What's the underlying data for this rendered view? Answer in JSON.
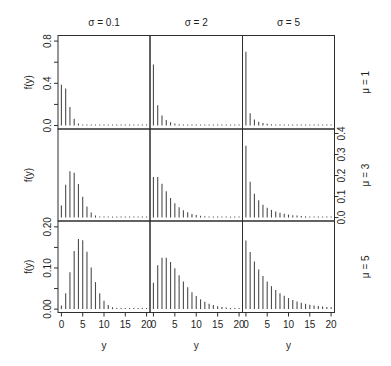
{
  "chart_data": {
    "type": "bar",
    "plot_style": "needle",
    "title": "",
    "xlabel": "y",
    "ylabel": "f(y)",
    "grid": false,
    "legend": null,
    "x": [
      0,
      1,
      2,
      3,
      4,
      5,
      6,
      7,
      8,
      9,
      10,
      11,
      12,
      13,
      14,
      15,
      16,
      17,
      18,
      19,
      20
    ],
    "xlim": [
      0,
      20
    ],
    "x_ticks": [
      0,
      5,
      10,
      15,
      20
    ],
    "x_tick_labels": [
      "0",
      "5",
      "10",
      "15",
      "20"
    ],
    "columns": [
      {
        "label": "σ = 0.1",
        "sigma": 0.1
      },
      {
        "label": "σ = 2",
        "sigma": 2
      },
      {
        "label": "σ = 5",
        "sigma": 5
      }
    ],
    "rows": [
      {
        "label": "μ = 1",
        "mu": 1,
        "ylim": [
          0,
          0.82
        ],
        "axis_side": "left",
        "y_ticks": [
          0,
          0.2,
          0.4,
          0.6,
          0.8
        ],
        "y_tick_labels": [
          "0.0",
          "",
          "0.4",
          "",
          "0.8"
        ]
      },
      {
        "label": "μ = 3",
        "mu": 3,
        "ylim": [
          0,
          0.405
        ],
        "axis_side": "right",
        "y_ticks": [
          0,
          0.1,
          0.2,
          0.3,
          0.4
        ],
        "y_tick_labels": [
          "0.0",
          "0.1",
          "0.2",
          "0.3",
          "0.4"
        ]
      },
      {
        "label": "μ = 5",
        "mu": 5,
        "ylim": [
          0,
          0.206
        ],
        "axis_side": "left",
        "y_ticks": [
          0,
          0.05,
          0.1,
          0.15,
          0.2
        ],
        "y_tick_labels": [
          "0.00",
          "",
          "0.10",
          "",
          "0.20"
        ]
      }
    ],
    "panels": [
      {
        "row": 0,
        "col": 0,
        "mu": 1,
        "sigma": 0.1,
        "values": [
          0.3855,
          0.3505,
          0.1752,
          0.0637,
          0.0188,
          0.0048,
          0.0011,
          0.0002,
          0,
          0,
          0,
          0,
          0,
          0,
          0,
          0,
          0,
          0,
          0,
          0,
          0
        ]
      },
      {
        "row": 0,
        "col": 1,
        "mu": 1,
        "sigma": 2,
        "values": [
          0.5774,
          0.1925,
          0.0962,
          0.0535,
          0.0312,
          0.0187,
          0.0114,
          0.0071,
          0.0044,
          0.0028,
          0.0018,
          0.0011,
          0.0007,
          0.0005,
          0.0003,
          0.0002,
          0.0001,
          0.0001,
          0.0001,
          0,
          0
        ]
      },
      {
        "row": 0,
        "col": 2,
        "mu": 1,
        "sigma": 5,
        "values": [
          0.6988,
          0.1165,
          0.0582,
          0.0356,
          0.0237,
          0.0166,
          0.012,
          0.0089,
          0.0066,
          0.005,
          0.0039,
          0.003,
          0.0023,
          0.0018,
          0.0014,
          0.0011,
          0.0009,
          0.0007,
          0.0006,
          0.0005,
          0.0004
        ]
      },
      {
        "row": 1,
        "col": 0,
        "mu": 3,
        "sigma": 0.1,
        "values": [
          0.0573,
          0.1563,
          0.2203,
          0.2136,
          0.1602,
          0.0991,
          0.0525,
          0.0246,
          0.0103,
          0.004,
          0.0014,
          0.0005,
          0.0001,
          0,
          0,
          0,
          0,
          0,
          0,
          0,
          0
        ]
      },
      {
        "row": 1,
        "col": 1,
        "mu": 3,
        "sigma": 2,
        "values": [
          0.1925,
          0.1925,
          0.1604,
          0.1247,
          0.0936,
          0.0686,
          0.0496,
          0.0354,
          0.0251,
          0.0176,
          0.0124,
          0.0086,
          0.006,
          0.0041,
          0.0029,
          0.002,
          0.0014,
          0.0009,
          0.0006,
          0.0004,
          0.0003
        ]
      },
      {
        "row": 1,
        "col": 2,
        "mu": 3,
        "sigma": 5,
        "values": [
          0.3413,
          0.1706,
          0.1138,
          0.0822,
          0.0616,
          0.0472,
          0.0367,
          0.0289,
          0.0229,
          0.0182,
          0.0146,
          0.0117,
          0.0094,
          0.0076,
          0.0062,
          0.005,
          0.0041,
          0.0033,
          0.0027,
          0.0022,
          0.0018
        ]
      },
      {
        "row": 2,
        "col": 0,
        "mu": 5,
        "sigma": 0.1,
        "values": [
          0.0085,
          0.0387,
          0.0898,
          0.1415,
          0.1704,
          0.1673,
          0.1394,
          0.1014,
          0.0657,
          0.0385,
          0.0206,
          0.0102,
          0.0047,
          0.0021,
          0.0008,
          0.0003,
          0.0001,
          0,
          0,
          0,
          0
        ]
      },
      {
        "row": 2,
        "col": 1,
        "mu": 5,
        "sigma": 2,
        "values": [
          0.0642,
          0.1069,
          0.1247,
          0.1247,
          0.1144,
          0.0991,
          0.0826,
          0.0669,
          0.0529,
          0.0412,
          0.0316,
          0.0239,
          0.0179,
          0.0133,
          0.0098,
          0.0072,
          0.0053,
          0.0038,
          0.0028,
          0.002,
          0.0014
        ]
      },
      {
        "row": 2,
        "col": 2,
        "mu": 5,
        "sigma": 5,
        "values": [
          0.1667,
          0.1389,
          0.1157,
          0.0965,
          0.0804,
          0.067,
          0.0558,
          0.0465,
          0.0388,
          0.0323,
          0.0269,
          0.0224,
          0.0187,
          0.0156,
          0.013,
          0.0108,
          0.009,
          0.0075,
          0.0063,
          0.0052,
          0.0043
        ]
      }
    ]
  }
}
